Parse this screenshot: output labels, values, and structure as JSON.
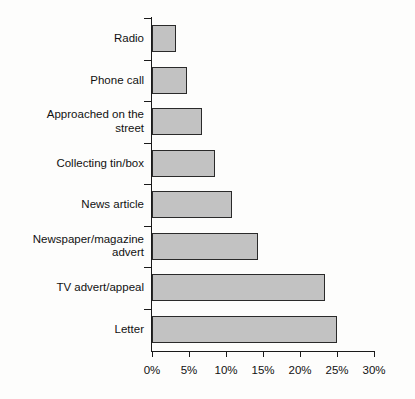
{
  "chart_data": {
    "type": "bar",
    "orientation": "horizontal",
    "title": "",
    "xlabel": "",
    "ylabel": "",
    "categories": [
      "Radio",
      "Phone call",
      "Approached on the\nstreet",
      "Collecting tin/box",
      "News article",
      "Newspaper/magazine\nadvert",
      "TV advert/appeal",
      "Letter"
    ],
    "values": [
      3.3,
      4.7,
      6.8,
      8.5,
      10.8,
      14.3,
      23.4,
      25.0
    ],
    "value_unit": "%",
    "xlim": [
      0,
      30
    ],
    "xticks": [
      0,
      5,
      10,
      15,
      20,
      25,
      30
    ],
    "xtick_labels": [
      "0%",
      "5%",
      "10%",
      "15%",
      "20%",
      "25%",
      "30%"
    ],
    "grid": false,
    "legend": false,
    "bar_fill_color": "#c2c2c2",
    "bar_edge_color": "#2a2a2a",
    "axis_color": "#1a1a1a",
    "background_color": "#fdfdfc"
  }
}
